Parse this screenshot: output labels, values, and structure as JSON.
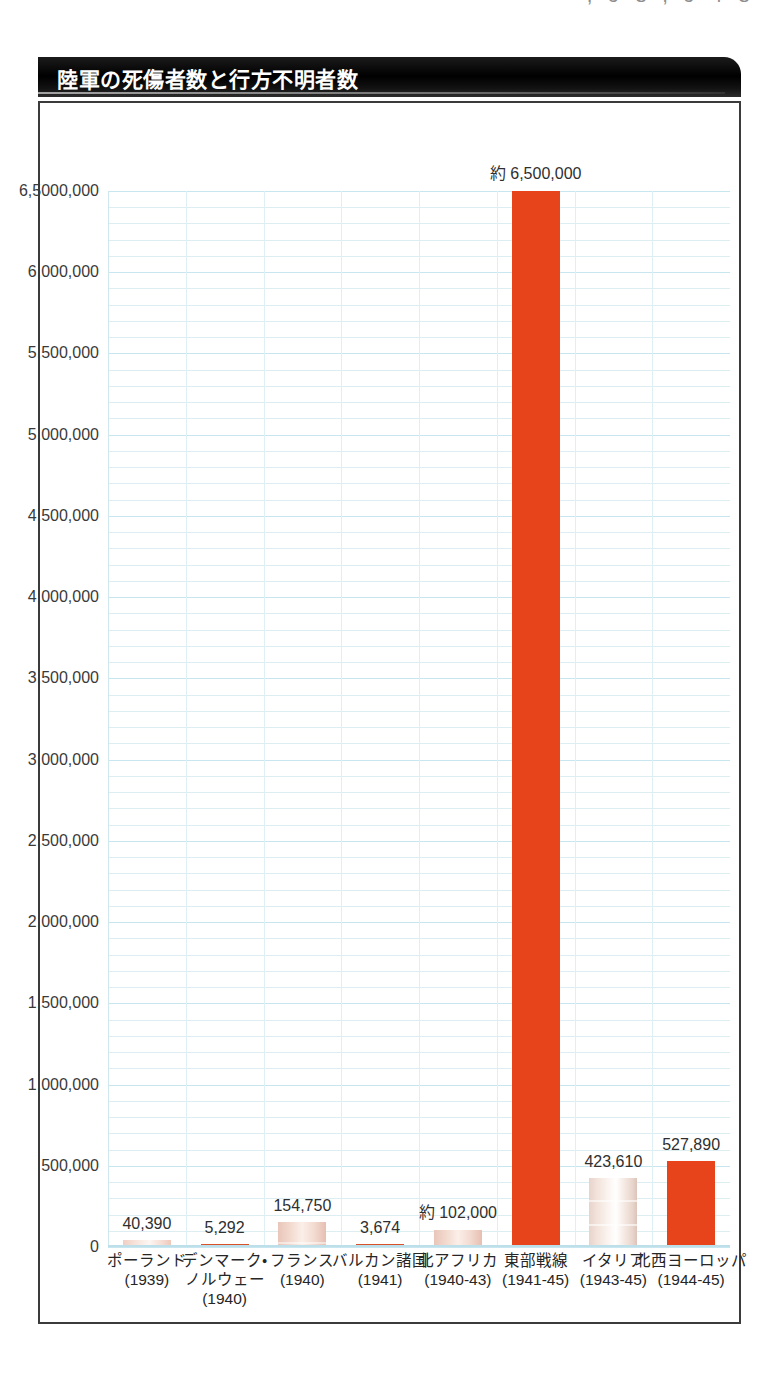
{
  "page": {
    "top_fragment": "‚ 9 8 ‚ 9 4 8"
  },
  "figure": {
    "title": "陸軍の死傷者数と行方不明者数"
  },
  "chart_data": {
    "type": "bar",
    "title": "陸軍の死傷者数と行方不明者数",
    "xlabel": "",
    "ylabel": "",
    "ylim": [
      0,
      6500000
    ],
    "grid": true,
    "legend": "none",
    "y_tick_labels": [
      "6,5000,000",
      "6,000,000",
      "5,500,000",
      "5,000,000",
      "4,500,000",
      "4,000,000",
      "3,500,000",
      "3,000,000",
      "2,500,000",
      "2,000,000",
      "1,500,000",
      "1,000,000",
      "500,000",
      "0"
    ],
    "y_tick_values": [
      6500000,
      6000000,
      5500000,
      5000000,
      4500000,
      4000000,
      3500000,
      3000000,
      2500000,
      2000000,
      1500000,
      1000000,
      500000,
      0
    ],
    "minor_tick_interval": 100000,
    "categories": [
      "ポーランド\n(1939)",
      "デンマーク・ノルウェー\n(1940)",
      "フランス\n(1940)",
      "バルカン諸国\n(1941)",
      "北アフリカ\n(1940-43)",
      "東部戦線\n(1941-45)",
      "イタリア\n(1943-45)",
      "北西ヨーロッパ\n(1944-45)"
    ],
    "values": [
      40390,
      5292,
      154750,
      3674,
      102000,
      6500000,
      423610,
      527890
    ],
    "data_labels": [
      "40,390",
      "5,292",
      "154,750",
      "3,674",
      "約 102,000",
      "約 6,500,000",
      "423,610",
      "527,890"
    ],
    "bars": [
      {
        "name": "ポーランド",
        "label_lines": [
          "ポーランド",
          "(1939)"
        ],
        "value": 40390,
        "value_label": "40,390",
        "style": "faint"
      },
      {
        "name": "デンマーク・ノルウェー",
        "label_lines": [
          "デンマーク・",
          "ノルウェー",
          "(1940)"
        ],
        "value": 5292,
        "value_label": "5,292",
        "style": "capline"
      },
      {
        "name": "フランス",
        "label_lines": [
          "フランス",
          "(1940)"
        ],
        "value": 154750,
        "value_label": "154,750",
        "style": "midtone"
      },
      {
        "name": "バルカン諸国",
        "label_lines": [
          "バルカン諸国",
          "(1941)"
        ],
        "value": 3674,
        "value_label": "3,674",
        "style": "capline"
      },
      {
        "name": "北アフリカ",
        "label_lines": [
          "北アフリカ",
          "(1940-43)"
        ],
        "value": 102000,
        "value_label": "約 102,000",
        "style": "midtone"
      },
      {
        "name": "東部戦線",
        "label_lines": [
          "東部戦線",
          "(1941-45)"
        ],
        "value": 6500000,
        "value_label": "約 6,500,000",
        "style": "solid"
      },
      {
        "name": "イタリア",
        "label_lines": [
          "イタリア",
          "(1943-45)"
        ],
        "value": 423610,
        "value_label": "423,610",
        "style": "pale"
      },
      {
        "name": "北西ヨーロッパ",
        "label_lines": [
          "北西ヨーロッパ",
          "(1944-45)"
        ],
        "value": 527890,
        "value_label": "527,890",
        "style": "solid"
      }
    ],
    "colors": {
      "bar_primary": "#e8441b",
      "bar_highlight": "#fbe6dd",
      "bar_pale": "#f3e7e1",
      "grid": "#ddeef3",
      "grid_major": "#c8e6ef",
      "title_banner": "#000000",
      "title_text": "#ffffff",
      "frame": "#3b3b3b",
      "label_text": "#262626"
    }
  }
}
